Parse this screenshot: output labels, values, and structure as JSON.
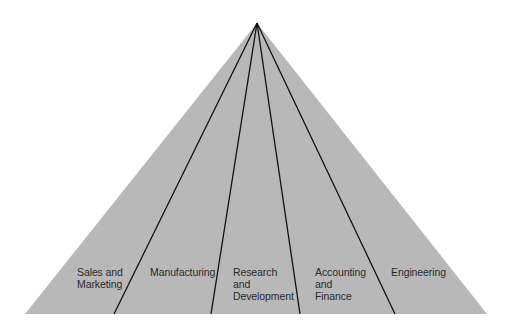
{
  "diagram": {
    "type": "pyramid",
    "colors": {
      "fill": "#b8b8b8",
      "line": "#111111",
      "background": "#ffffff"
    },
    "apex": [
      257,
      23
    ],
    "base": {
      "y": 314,
      "left": 25,
      "right": 487
    },
    "dividers_bottom_x": [
      114,
      211,
      300,
      395
    ],
    "segments": [
      {
        "label_lines": [
          "Sales and",
          "Marketing"
        ]
      },
      {
        "label_lines": [
          "Manufacturing"
        ]
      },
      {
        "label_lines": [
          "Research",
          "and",
          "Development"
        ]
      },
      {
        "label_lines": [
          "Accounting",
          "and",
          "Finance"
        ]
      },
      {
        "label_lines": [
          "Engineering"
        ]
      }
    ]
  }
}
